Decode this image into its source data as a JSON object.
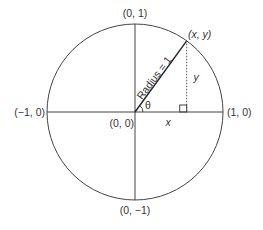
{
  "diagram": {
    "labels": {
      "top": "(0, 1)",
      "bottom": "(0, −1)",
      "left": "(−1, 0)",
      "right": "(1, 0)",
      "origin": "(0, 0)",
      "point": "(x, y)",
      "radius": "Radius = 1",
      "angle": "θ",
      "x_leg": "x",
      "y_leg": "y"
    },
    "point_angle_degrees": 54,
    "colors": {
      "stroke": "#444444",
      "text": "#333333"
    }
  }
}
